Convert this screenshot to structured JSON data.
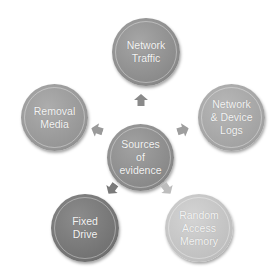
{
  "diagram": {
    "center": {
      "label": "Sources\nof\nevidence",
      "color": "#8c8c8c"
    },
    "nodes": [
      {
        "id": "network-traffic",
        "label": "Network\nTraffic",
        "color": "#909090"
      },
      {
        "id": "network-device-logs",
        "label": "Network\n& Device\nLogs",
        "color": "#a4a4a4"
      },
      {
        "id": "random-access-memory",
        "label": "Random\nAccess\nMemory",
        "color": "#c2c2c2"
      },
      {
        "id": "fixed-drive",
        "label": "Fixed\nDrive",
        "color": "#767676"
      },
      {
        "id": "removal-media",
        "label": "Removal\nMedia",
        "color": "#9a9a9a"
      }
    ],
    "arrow_colors": {
      "up": "#8a8a8a",
      "right": "#9e9e9e",
      "down_right": "#bdbdbd",
      "down_left": "#7a7a7a",
      "left": "#9a9a9a"
    }
  }
}
